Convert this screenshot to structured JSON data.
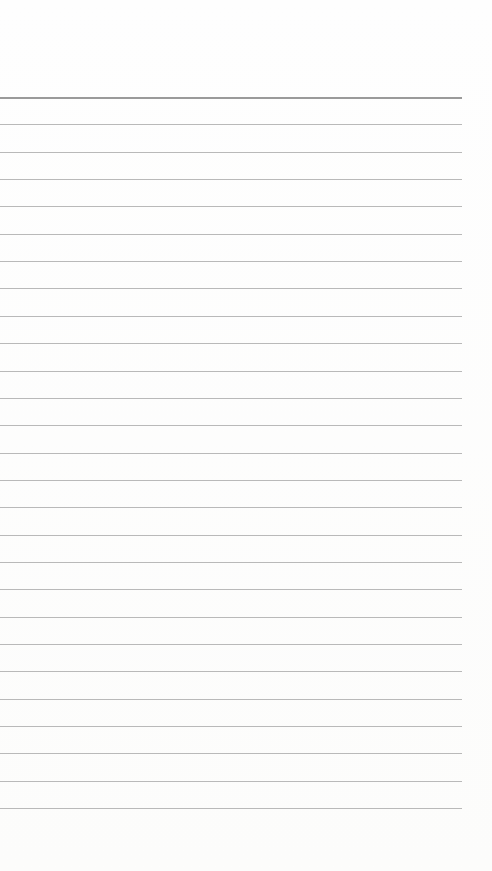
{
  "page": {
    "type": "ruled-notebook-page",
    "content": "",
    "line_count": 27,
    "first_line_y": 97,
    "line_spacing": 27.35,
    "line_width": 462,
    "colors": {
      "paper": "#fdfdfc",
      "rule": "#b9b9b9",
      "top_rule": "#9a9a9a"
    }
  }
}
